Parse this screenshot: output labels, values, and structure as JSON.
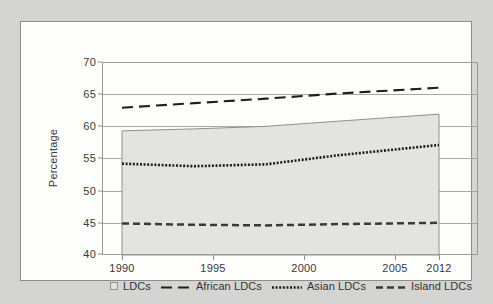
{
  "chart_data": {
    "type": "area",
    "title": "",
    "xlabel": "",
    "ylabel": "Percentage",
    "xlim": [
      1990,
      2012
    ],
    "ylim": [
      40,
      70
    ],
    "x_ticks": [
      1990,
      1995,
      2000,
      2005,
      2012
    ],
    "y_ticks": [
      40,
      45,
      50,
      55,
      60,
      65,
      70
    ],
    "grid": true,
    "legend_position": "bottom",
    "x": [
      1990,
      1995,
      2000,
      2005,
      2012
    ],
    "series": [
      {
        "name": "LDCs",
        "style": "shaded-band",
        "values_upper": [
          59.3,
          59.6,
          60.0,
          60.8,
          61.9
        ],
        "values_lower": [
          40.0,
          40.0,
          40.0,
          40.0,
          40.0
        ]
      },
      {
        "name": "African LDCs",
        "style": "long-dashed",
        "values": [
          62.9,
          63.6,
          64.3,
          65.1,
          66.0
        ]
      },
      {
        "name": "Asian LDCs",
        "style": "dotted",
        "values": [
          54.2,
          53.8,
          54.1,
          55.5,
          57.1
        ]
      },
      {
        "name": "Island LDCs",
        "style": "dash-dot",
        "values": [
          44.9,
          44.7,
          44.6,
          44.8,
          45.0
        ]
      }
    ]
  },
  "axes": {
    "ylabel": "Percentage",
    "y_tick_labels": [
      "70",
      "65",
      "60",
      "55",
      "50",
      "45",
      "40"
    ],
    "x_tick_labels": [
      "1990",
      "1995",
      "2000",
      "2005",
      "2012"
    ]
  },
  "legend": {
    "items": [
      {
        "label": "LDCs",
        "marker": "shaded-box-swatch"
      },
      {
        "label": "African LDCs",
        "marker": "long-dash-line-swatch"
      },
      {
        "label": "Asian LDCs",
        "marker": "dotted-line-swatch"
      },
      {
        "label": "Island LDCs",
        "marker": "dash-dot-line-swatch"
      }
    ]
  },
  "colors": {
    "page_background": "#d4d4d2",
    "panel_background": "#fdfdfc",
    "band_fill": "#e3e3e1",
    "band_stroke": "#8f8f8d",
    "line": "#1f1f1f",
    "grid": "#a7a7a5",
    "frame": "#8d8d8b",
    "text": "#3a3a3a"
  }
}
